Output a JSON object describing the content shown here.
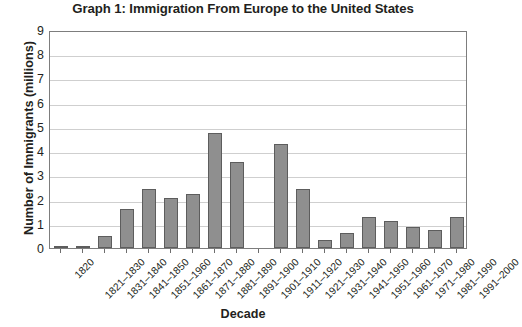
{
  "chart_data": {
    "type": "bar",
    "title": "Graph 1: Immigration From Europe to the United States",
    "xlabel": "Decade",
    "ylabel": "Number of Immigrants (millions)",
    "ylim": [
      0,
      9
    ],
    "ytick_labels": [
      "9",
      "8",
      "7",
      "6",
      "5",
      "4",
      "3",
      "2",
      "1",
      "0"
    ],
    "ytick_values": [
      9,
      8,
      7,
      6,
      5,
      4,
      3,
      2,
      1,
      0
    ],
    "grid": true,
    "legend": "none",
    "bar_color": "#8f8f8f",
    "bar_border_color": "#5d5d5d",
    "categories": [
      "1820",
      "1821–1830",
      "1831–1840",
      "1841–1850",
      "1851–1960",
      "1861–1870",
      "1871–1880",
      "1881–1890",
      "1891–1900",
      "1901–1910",
      "1911–1920",
      "1921–1930",
      "1931–1940",
      "1941–1950",
      "1951–1960",
      "1961–1970",
      "1971–1980",
      "1981–1990",
      "1991–2000"
    ],
    "values": [
      0.02,
      0.1,
      0.5,
      1.6,
      2.45,
      2.05,
      2.25,
      4.75,
      3.55,
      0,
      4.3,
      2.45,
      0.35,
      0.6,
      1.3,
      1.1,
      0.85,
      0.75,
      1.3
    ]
  }
}
